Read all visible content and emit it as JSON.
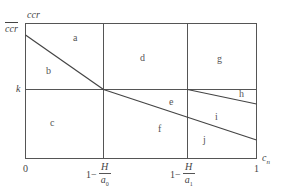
{
  "figure": {
    "y_axis": {
      "label_top": "ccr",
      "label_top_overlined": "ccr",
      "mid_label": "k"
    },
    "x_axis": {
      "label": "c",
      "label_sub": "n",
      "ticks": [
        {
          "text": "0"
        },
        {
          "prefix": "1−",
          "numerator": "H",
          "denominator": "a",
          "denominator_sub": "0"
        },
        {
          "prefix": "1−",
          "numerator": "H",
          "denominator": "a",
          "denominator_sub": "1"
        },
        {
          "text": "1"
        }
      ]
    },
    "regions": [
      "a",
      "b",
      "c",
      "d",
      "e",
      "f",
      "g",
      "h",
      "i",
      "j"
    ],
    "colors": {
      "line": "#555555",
      "text": "#444444"
    }
  }
}
